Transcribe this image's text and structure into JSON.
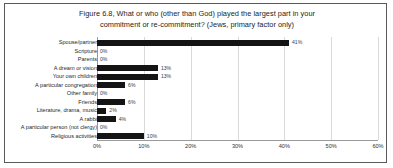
{
  "chart_data": {
    "type": "bar",
    "orientation": "horizontal",
    "title": "Figure 6.8, What or who (other than God) played the largest part in your commitment or re-commitment? (Jews, primary factor only)",
    "title_lines": [
      "Figure 6.8, What or who (other than God) played the largest part in your",
      "commitment or re-commitment? (Jews, primary factor only)"
    ],
    "xlabel": "",
    "ylabel": "",
    "xlim": [
      0,
      60
    ],
    "xticks": [
      0,
      10,
      20,
      30,
      40,
      50,
      60
    ],
    "xtick_labels": [
      "0%",
      "10%",
      "20%",
      "30%",
      "40%",
      "50%",
      "60%"
    ],
    "grid": true,
    "legend": false,
    "bar_color": "#141414",
    "categories": [
      "Spouse/partner",
      "Scripture",
      "Parents",
      "A dream or vision",
      "Your own children",
      "A particular congregation",
      "Other family",
      "Friends",
      "Literature, drama, music",
      "A rabbi",
      "A particular person (not clergy)",
      "Religious activities"
    ],
    "values": [
      41,
      0,
      0,
      13,
      13,
      6,
      0,
      6,
      2,
      4,
      0,
      10
    ],
    "value_labels": [
      "41%",
      "0%",
      "0%",
      "13%",
      "13%",
      "6%",
      "0%",
      "6%",
      "2%",
      "4%",
      "0%",
      "10%"
    ]
  }
}
